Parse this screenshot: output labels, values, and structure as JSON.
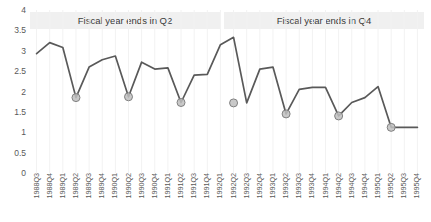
{
  "chart_data": {
    "type": "line",
    "title": "",
    "xlabel": "",
    "ylabel": "",
    "ylim": [
      0,
      4
    ],
    "y_ticks": [
      4,
      3.5,
      3,
      2.5,
      2,
      1.5,
      1,
      0.5,
      0
    ],
    "y_tick_labels": [
      "4",
      "3.5",
      "3",
      "2.5",
      "2",
      "1.5",
      "1",
      "0.5",
      "0"
    ],
    "grid": "vertical-light",
    "legend": "none",
    "categories": [
      "1988Q3",
      "1988Q4",
      "1989Q1",
      "1989Q2",
      "1989Q3",
      "1989Q4",
      "1990Q1",
      "1990Q2",
      "1990Q3",
      "1990Q4",
      "1991Q1",
      "1991Q2",
      "1991Q3",
      "1991Q4",
      "1992Q1",
      "1992Q2",
      "1992Q3",
      "1992Q4",
      "1993Q1",
      "1993Q2",
      "1993Q3",
      "1993Q4",
      "1994Q1",
      "1994Q2",
      "1994Q3",
      "1994Q4",
      "1995Q1",
      "1995Q2",
      "1995Q3",
      "1995Q4"
    ],
    "values": [
      2.93,
      3.2,
      3.08,
      1.85,
      2.6,
      2.78,
      2.87,
      1.87,
      2.72,
      2.55,
      2.58,
      1.73,
      2.4,
      2.42,
      3.15,
      3.33,
      1.72,
      2.55,
      2.6,
      1.45,
      2.05,
      2.1,
      2.1,
      1.4,
      1.73,
      1.85,
      2.12,
      1.12,
      1.12,
      1.12
    ],
    "highlighted_points": [
      {
        "category": "1989Q2",
        "value": 1.85
      },
      {
        "category": "1990Q2",
        "value": 1.87
      },
      {
        "category": "1991Q2",
        "value": 1.73
      },
      {
        "category": "1992Q2",
        "value": 1.72
      },
      {
        "category": "1993Q2",
        "value": 1.45
      },
      {
        "category": "1994Q2",
        "value": 1.4
      },
      {
        "category": "1995Q2",
        "value": 1.12
      }
    ],
    "series_color": "#595959",
    "marker_fill": "#bfbfbf",
    "marker_stroke": "#808080",
    "band_color": "#f0f0f0"
  },
  "bands": {
    "q2": {
      "label": "Fiscal year ends in Q2"
    },
    "q4": {
      "label": "Fiscal year ends in Q4"
    }
  }
}
